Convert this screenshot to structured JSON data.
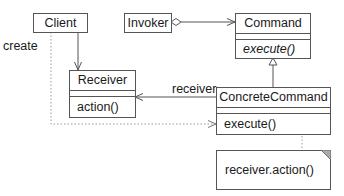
{
  "diagram": {
    "type": "UML class diagram",
    "pattern": "Command",
    "classes": {
      "client": {
        "name": "Client"
      },
      "invoker": {
        "name": "Invoker"
      },
      "command": {
        "name": "Command",
        "operations": [
          "execute()"
        ],
        "operation_style": "italic"
      },
      "receiver": {
        "name": "Receiver",
        "operations": [
          "action()"
        ]
      },
      "concrete_command": {
        "name": "ConcreteCommand",
        "operations": [
          "execute()"
        ]
      }
    },
    "labels": {
      "create": "create",
      "receiver_role": "receiver"
    },
    "note": {
      "text": "receiver.action()"
    },
    "relationships": [
      {
        "from": "Invoker",
        "to": "Command",
        "kind": "aggregation"
      },
      {
        "from": "Client",
        "to": "Receiver",
        "kind": "association"
      },
      {
        "from": "ConcreteCommand",
        "to": "Command",
        "kind": "generalization"
      },
      {
        "from": "ConcreteCommand",
        "to": "Receiver",
        "kind": "association",
        "role": "receiver"
      },
      {
        "from": "Client",
        "to": "ConcreteCommand",
        "kind": "dependency",
        "label": "create"
      },
      {
        "from": "ConcreteCommand.execute()",
        "to": "note",
        "kind": "note-anchor"
      }
    ],
    "colors": {
      "line": "#555555",
      "text": "#1a1a1a",
      "dotted": "#999999",
      "background": "#ffffff"
    }
  }
}
